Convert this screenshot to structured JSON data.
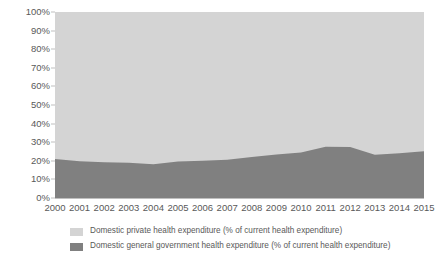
{
  "chart_data": {
    "type": "area",
    "stacked": true,
    "normalized": true,
    "title": "",
    "subtitle": "",
    "xlabel": "",
    "ylabel": "",
    "grid": false,
    "legend_position": "bottom",
    "categories": [
      "2000",
      "2001",
      "2002",
      "2003",
      "2004",
      "2005",
      "2006",
      "2007",
      "2008",
      "2009",
      "2010",
      "2011",
      "2012",
      "2013",
      "2014",
      "2015"
    ],
    "x": [
      2000,
      2001,
      2002,
      2003,
      2004,
      2005,
      2006,
      2007,
      2008,
      2009,
      2010,
      2011,
      2012,
      2013,
      2014,
      2015
    ],
    "ylim": [
      0,
      100
    ],
    "ytick_labels": [
      "0%",
      "10%",
      "20%",
      "30%",
      "40%",
      "50%",
      "60%",
      "70%",
      "80%",
      "90%",
      "100%"
    ],
    "ytick_values": [
      0,
      10,
      20,
      30,
      40,
      50,
      60,
      70,
      80,
      90,
      100
    ],
    "series": [
      {
        "name": "Domestic general government health expenditure (% of current health expenditure)",
        "color": "#808080",
        "values": [
          21.0,
          19.8,
          19.2,
          19.0,
          18.2,
          19.6,
          20.0,
          20.6,
          22.0,
          23.4,
          24.4,
          27.6,
          27.4,
          23.2,
          24.0,
          25.2
        ]
      },
      {
        "name": "Domestic private health expenditure (% of current health expenditure)",
        "color": "#d4d4d4",
        "values": [
          79.0,
          80.2,
          80.8,
          81.0,
          81.8,
          80.4,
          80.0,
          79.4,
          78.0,
          76.6,
          75.6,
          72.4,
          72.6,
          76.8,
          76.0,
          74.8
        ]
      }
    ]
  },
  "legend": {
    "items": [
      {
        "label": "Domestic private health expenditure (% of current health expenditure)",
        "color": "#d4d4d4"
      },
      {
        "label": "Domestic general government health expenditure (% of current health expenditure)",
        "color": "#808080"
      }
    ]
  }
}
